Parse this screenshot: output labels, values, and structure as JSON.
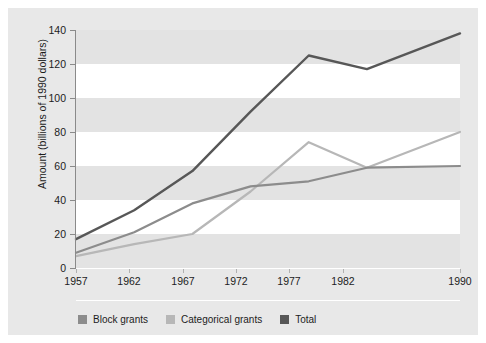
{
  "chart_data": {
    "type": "line",
    "title": "",
    "xlabel": "",
    "ylabel": "Amount (billions of 1990 dollars)",
    "categories": [
      "1957",
      "1962",
      "1967",
      "1972",
      "1977",
      "1982",
      "1990"
    ],
    "ylim": [
      0,
      140
    ],
    "yticks": [
      "0",
      "20",
      "40",
      "60",
      "80",
      "100",
      "120",
      "140"
    ],
    "grid": "horizontal-bands",
    "legend_position": "bottom-left",
    "series": [
      {
        "name": "Block grants",
        "color": "#8c8c8c",
        "values": [
          9,
          21,
          38,
          48,
          51,
          59,
          60
        ]
      },
      {
        "name": "Categorical grants",
        "color": "#b7b7b7",
        "values": [
          7,
          14,
          20,
          45,
          74,
          59,
          80
        ]
      },
      {
        "name": "Total",
        "color": "#575757",
        "values": [
          17,
          34,
          57,
          92,
          125,
          117,
          138
        ]
      }
    ]
  },
  "legend": {
    "items": [
      {
        "label": "Block grants",
        "color": "#8c8c8c"
      },
      {
        "label": "Categorical grants",
        "color": "#b7b7b7"
      },
      {
        "label": "Total",
        "color": "#575757"
      }
    ]
  },
  "colors": {
    "card_background": "#e8e8e8",
    "plot_background": "#ffffff",
    "band": "#e3e3e3",
    "axis": "#8a8a8a",
    "text": "#1c1c1c"
  }
}
